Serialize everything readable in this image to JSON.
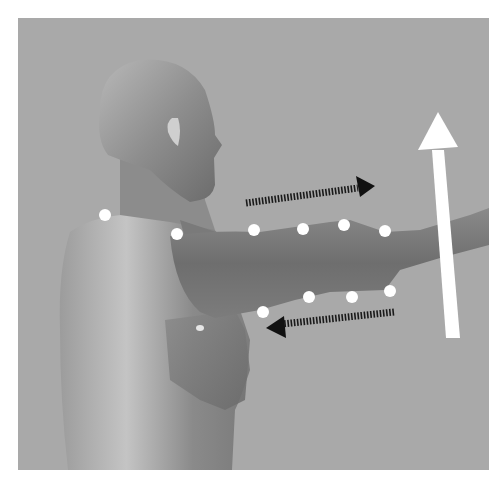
{
  "figure": {
    "colors": {
      "background": "#a9a9a9",
      "frame_bg": "#ffffff",
      "skin_light": "#c8c8c8",
      "skin_mid": "#9a9a9a",
      "skin_dark": "#6e6e6e",
      "marker": "#ffffff",
      "arrow_dark": "#111111",
      "arrow_light": "#ffffff"
    },
    "markers_upper": [
      [
        105,
        215
      ],
      [
        177,
        234
      ],
      [
        254,
        230
      ],
      [
        303,
        229
      ],
      [
        344,
        225
      ],
      [
        385,
        231
      ]
    ],
    "markers_lower": [
      [
        263,
        312
      ],
      [
        309,
        297
      ],
      [
        352,
        297
      ],
      [
        390,
        291
      ]
    ],
    "markers_torso": [
      [
        200,
        328
      ]
    ],
    "arrows": {
      "dashed_right": {
        "from": [
          246,
          203
        ],
        "to": [
          374,
          186
        ],
        "direction": "right"
      },
      "dashed_left": {
        "from": [
          394,
          312
        ],
        "to": [
          265,
          327
        ],
        "direction": "left"
      },
      "white_up": {
        "from": [
          452,
          338
        ],
        "to": [
          438,
          112
        ],
        "direction": "up"
      }
    }
  }
}
